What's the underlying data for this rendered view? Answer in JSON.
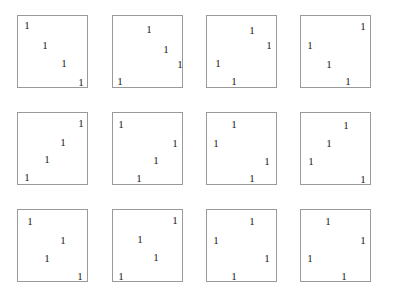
{
  "figure": {
    "glyph_character": "1",
    "background_color": "#ffffff",
    "panel_border_color": "#9a9a9a",
    "glyph_color": "#1a1a1a",
    "rows": 3,
    "columns": 4,
    "panel_count": 12,
    "glyphs_per_panel": 4
  },
  "panels": [
    {
      "id": "panel-r1c1",
      "row": 1,
      "column": 1,
      "x": 17,
      "y": 15,
      "width": 71,
      "height": 73,
      "arrangement": "descending-diagonal",
      "glyphs": [
        {
          "label": "1",
          "x": 9,
          "y": 9
        },
        {
          "label": "1",
          "x": 27,
          "y": 29
        },
        {
          "label": "1",
          "x": 46,
          "y": 47
        },
        {
          "label": "1",
          "x": 63,
          "y": 66
        }
      ]
    },
    {
      "id": "panel-r1c2",
      "row": 1,
      "column": 2,
      "x": 112,
      "y": 15,
      "width": 71,
      "height": 73,
      "arrangement": "descending-diagonal-with-outlier",
      "glyphs": [
        {
          "label": "1",
          "x": 36,
          "y": 13
        },
        {
          "label": "1",
          "x": 53,
          "y": 33
        },
        {
          "label": "1",
          "x": 67,
          "y": 48
        },
        {
          "label": "1",
          "x": 7,
          "y": 65
        }
      ]
    },
    {
      "id": "panel-r1c3",
      "row": 1,
      "column": 3,
      "x": 206,
      "y": 15,
      "width": 71,
      "height": 73,
      "arrangement": "scattered",
      "glyphs": [
        {
          "label": "1",
          "x": 45,
          "y": 14
        },
        {
          "label": "1",
          "x": 62,
          "y": 29
        },
        {
          "label": "1",
          "x": 11,
          "y": 47
        },
        {
          "label": "1",
          "x": 27,
          "y": 65
        }
      ]
    },
    {
      "id": "panel-r1c4",
      "row": 1,
      "column": 4,
      "x": 300,
      "y": 15,
      "width": 71,
      "height": 73,
      "arrangement": "scattered",
      "glyphs": [
        {
          "label": "1",
          "x": 62,
          "y": 10
        },
        {
          "label": "1",
          "x": 9,
          "y": 29
        },
        {
          "label": "1",
          "x": 28,
          "y": 48
        },
        {
          "label": "1",
          "x": 47,
          "y": 65
        }
      ]
    },
    {
      "id": "panel-r2c1",
      "row": 2,
      "column": 1,
      "x": 17,
      "y": 112,
      "width": 71,
      "height": 73,
      "arrangement": "ascending-diagonal",
      "glyphs": [
        {
          "label": "1",
          "x": 63,
          "y": 10
        },
        {
          "label": "1",
          "x": 45,
          "y": 29
        },
        {
          "label": "1",
          "x": 29,
          "y": 46
        },
        {
          "label": "1",
          "x": 9,
          "y": 64
        }
      ]
    },
    {
      "id": "panel-r2c2",
      "row": 2,
      "column": 2,
      "x": 112,
      "y": 112,
      "width": 71,
      "height": 73,
      "arrangement": "scattered",
      "glyphs": [
        {
          "label": "1",
          "x": 8,
          "y": 11
        },
        {
          "label": "1",
          "x": 62,
          "y": 30
        },
        {
          "label": "1",
          "x": 43,
          "y": 47
        },
        {
          "label": "1",
          "x": 26,
          "y": 65
        }
      ]
    },
    {
      "id": "panel-r2c3",
      "row": 2,
      "column": 3,
      "x": 206,
      "y": 112,
      "width": 71,
      "height": 73,
      "arrangement": "scattered",
      "glyphs": [
        {
          "label": "1",
          "x": 27,
          "y": 11
        },
        {
          "label": "1",
          "x": 9,
          "y": 30
        },
        {
          "label": "1",
          "x": 60,
          "y": 48
        },
        {
          "label": "1",
          "x": 45,
          "y": 65
        }
      ]
    },
    {
      "id": "panel-r2c4",
      "row": 2,
      "column": 4,
      "x": 300,
      "y": 112,
      "width": 71,
      "height": 73,
      "arrangement": "scattered",
      "glyphs": [
        {
          "label": "1",
          "x": 45,
          "y": 12
        },
        {
          "label": "1",
          "x": 28,
          "y": 30
        },
        {
          "label": "1",
          "x": 10,
          "y": 48
        },
        {
          "label": "1",
          "x": 62,
          "y": 66
        }
      ]
    },
    {
      "id": "panel-r3c1",
      "row": 3,
      "column": 1,
      "x": 17,
      "y": 209,
      "width": 71,
      "height": 73,
      "arrangement": "zigzag",
      "glyphs": [
        {
          "label": "1",
          "x": 12,
          "y": 11
        },
        {
          "label": "1",
          "x": 45,
          "y": 30
        },
        {
          "label": "1",
          "x": 29,
          "y": 48
        },
        {
          "label": "1",
          "x": 62,
          "y": 66
        }
      ]
    },
    {
      "id": "panel-r3c2",
      "row": 3,
      "column": 2,
      "x": 112,
      "y": 209,
      "width": 71,
      "height": 73,
      "arrangement": "ascending-diagonal",
      "glyphs": [
        {
          "label": "1",
          "x": 62,
          "y": 10
        },
        {
          "label": "1",
          "x": 27,
          "y": 29
        },
        {
          "label": "1",
          "x": 43,
          "y": 47
        },
        {
          "label": "1",
          "x": 8,
          "y": 66
        }
      ]
    },
    {
      "id": "panel-r3c3",
      "row": 3,
      "column": 3,
      "x": 206,
      "y": 209,
      "width": 71,
      "height": 73,
      "arrangement": "scattered",
      "glyphs": [
        {
          "label": "1",
          "x": 45,
          "y": 11
        },
        {
          "label": "1",
          "x": 9,
          "y": 30
        },
        {
          "label": "1",
          "x": 60,
          "y": 48
        },
        {
          "label": "1",
          "x": 27,
          "y": 66
        }
      ]
    },
    {
      "id": "panel-r3c4",
      "row": 3,
      "column": 4,
      "x": 300,
      "y": 209,
      "width": 71,
      "height": 73,
      "arrangement": "scattered",
      "glyphs": [
        {
          "label": "1",
          "x": 27,
          "y": 11
        },
        {
          "label": "1",
          "x": 62,
          "y": 30
        },
        {
          "label": "1",
          "x": 9,
          "y": 48
        },
        {
          "label": "1",
          "x": 43,
          "y": 66
        }
      ]
    }
  ]
}
